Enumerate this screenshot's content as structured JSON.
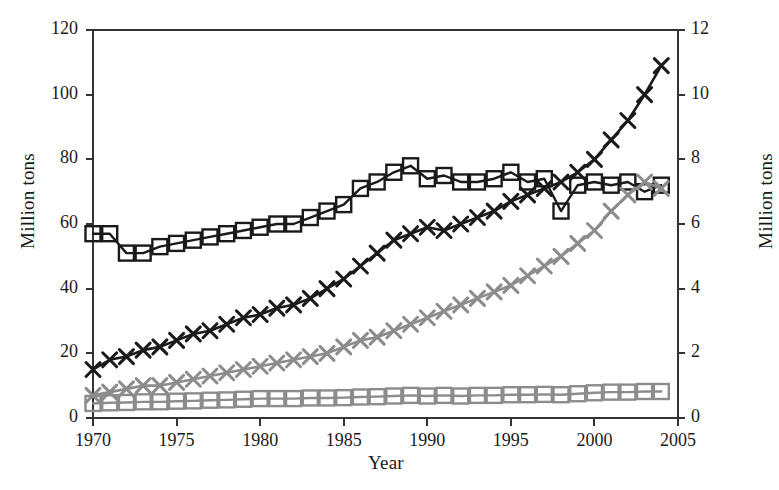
{
  "chart_data": {
    "type": "line",
    "title": "",
    "subtitle": "",
    "xlabel": "Year",
    "ylabel": "Million tons",
    "ylabel_right": "Million tons",
    "xlim": [
      1970,
      2005
    ],
    "ylim": [
      0,
      120
    ],
    "ylim_right": [
      0,
      12
    ],
    "xticks": [
      1970,
      1975,
      1980,
      1985,
      1990,
      1995,
      2000,
      2005
    ],
    "xticklabels": [
      "1970",
      "1975",
      "1980",
      "1985",
      "1990",
      "1995",
      "2000",
      "2005"
    ],
    "yticks": [
      0,
      20,
      40,
      60,
      80,
      100,
      120
    ],
    "yticklabels": [
      "0",
      "20",
      "40",
      "60",
      "80",
      "100",
      "120"
    ],
    "yticks_right": [
      0,
      2,
      4,
      6,
      8,
      10,
      12
    ],
    "yticklabels_right": [
      "0",
      "2",
      "4",
      "6",
      "8",
      "10",
      "12"
    ],
    "grid": false,
    "legend": "none",
    "colors": {
      "black_series": "#1a1a1a",
      "gray_series": "#8c8c8c",
      "axis": "#333333",
      "background": "#ffffff"
    },
    "x": [
      1970,
      1971,
      1972,
      1973,
      1974,
      1975,
      1976,
      1977,
      1978,
      1979,
      1980,
      1981,
      1982,
      1983,
      1984,
      1985,
      1986,
      1987,
      1988,
      1989,
      1990,
      1991,
      1992,
      1993,
      1994,
      1995,
      1996,
      1997,
      1998,
      1999,
      2000,
      2001,
      2002,
      2003,
      2004
    ],
    "series": [
      {
        "name": "black-squares",
        "axis": "left",
        "marker": "square",
        "color": "#1a1a1a",
        "values": [
          57,
          57,
          51,
          51,
          53,
          54,
          55,
          56,
          57,
          58,
          59,
          60,
          60,
          62,
          64,
          66,
          71,
          73,
          76,
          78,
          74,
          75,
          73,
          73,
          74,
          76,
          73,
          74,
          64,
          72,
          73,
          72,
          73,
          70,
          72
        ]
      },
      {
        "name": "black-crosses",
        "axis": "right",
        "marker": "cross",
        "color": "#1a1a1a",
        "values": [
          1.5,
          1.8,
          1.9,
          2.1,
          2.2,
          2.4,
          2.6,
          2.7,
          2.9,
          3.1,
          3.2,
          3.4,
          3.5,
          3.7,
          4.0,
          4.3,
          4.7,
          5.1,
          5.5,
          5.7,
          5.9,
          5.8,
          6.0,
          6.2,
          6.4,
          6.7,
          6.9,
          7.1,
          7.3,
          7.6,
          8.0,
          8.6,
          9.2,
          10.0,
          10.9
        ]
      },
      {
        "name": "gray-crosses",
        "axis": "right",
        "marker": "cross",
        "color": "#8c8c8c",
        "values": [
          0.7,
          0.8,
          0.9,
          1.0,
          1.0,
          1.1,
          1.2,
          1.3,
          1.4,
          1.5,
          1.6,
          1.7,
          1.8,
          1.9,
          2.0,
          2.2,
          2.4,
          2.5,
          2.7,
          2.9,
          3.1,
          3.3,
          3.5,
          3.7,
          3.9,
          4.1,
          4.4,
          4.7,
          5.0,
          5.4,
          5.8,
          6.4,
          6.9,
          7.3,
          7.1
        ]
      },
      {
        "name": "gray-squares",
        "axis": "right",
        "marker": "square",
        "color": "#8c8c8c",
        "values": [
          0.45,
          0.47,
          0.48,
          0.5,
          0.5,
          0.52,
          0.53,
          0.55,
          0.56,
          0.58,
          0.6,
          0.6,
          0.6,
          0.62,
          0.62,
          0.63,
          0.65,
          0.66,
          0.68,
          0.7,
          0.68,
          0.7,
          0.68,
          0.7,
          0.7,
          0.72,
          0.72,
          0.73,
          0.72,
          0.75,
          0.78,
          0.8,
          0.8,
          0.82,
          0.82
        ]
      }
    ]
  }
}
